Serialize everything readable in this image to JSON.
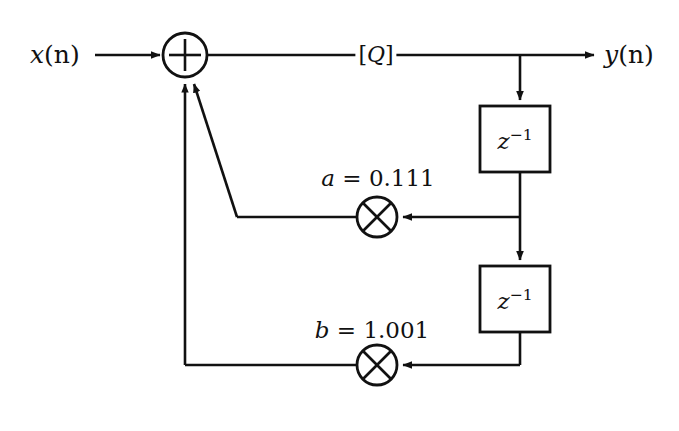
{
  "diagram": {
    "type": "signal-flow-block-diagram",
    "stroke_color": "#111111",
    "background_color": "#ffffff",
    "input": {
      "label_var": "x",
      "label_arg": "(n)",
      "label_full": "x(n)"
    },
    "output": {
      "label_var": "y",
      "label_arg": "(n)",
      "label_full": "y(n)"
    },
    "adder": {
      "symbol": "+",
      "name": "summing-junction"
    },
    "quantizer": {
      "label": "[Q]",
      "bracket_open": "[",
      "symbol": "Q",
      "bracket_close": "]"
    },
    "delays": [
      {
        "id": "delay-1",
        "base": "z",
        "exponent": "−1",
        "label_full": "z⁻¹"
      },
      {
        "id": "delay-2",
        "base": "z",
        "exponent": "−1",
        "label_full": "z⁻¹"
      }
    ],
    "multipliers": [
      {
        "id": "multiplier-a",
        "symbol": "×",
        "coefficient_name": "a",
        "equals": "=",
        "coefficient_value": "0.111",
        "label_full": "a = 0.111"
      },
      {
        "id": "multiplier-b",
        "symbol": "×",
        "coefficient_name": "b",
        "equals": "=",
        "coefficient_value": "1.001",
        "label_full": "b = 1.001"
      }
    ]
  }
}
